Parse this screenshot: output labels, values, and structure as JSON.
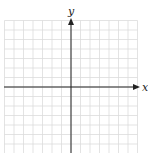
{
  "diagram": {
    "type": "coordinate-grid",
    "axes": {
      "x_label": "x",
      "y_label": "y"
    },
    "grid": {
      "cells_left": 7,
      "cells_right": 7,
      "cells_up": 7,
      "cells_down": 7
    },
    "colors": {
      "grid": "#d9d9d9",
      "axis": "#222222",
      "background": "#ffffff"
    }
  }
}
